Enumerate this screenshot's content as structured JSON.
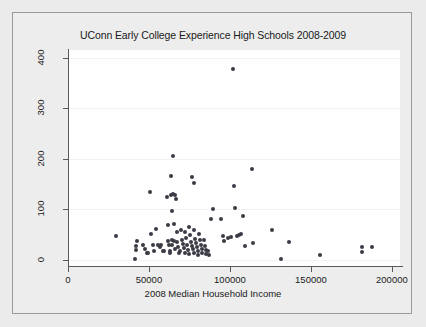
{
  "chart_data": {
    "type": "scatter",
    "title": "UConn Early College Experience High Schools 2008-2009",
    "xlabel": "2008 Median Household Income",
    "ylabel": "",
    "xlim": [
      0,
      205000
    ],
    "ylim": [
      -12,
      415
    ],
    "xticks": [
      0,
      50000,
      100000,
      150000,
      200000
    ],
    "xtick_labels": [
      "0",
      "50000",
      "100000",
      "150000",
      "200000"
    ],
    "yticks": [
      0,
      100,
      200,
      300,
      400
    ],
    "ytick_labels": [
      "0",
      "100",
      "200",
      "300",
      "400"
    ],
    "grid": "horizontal-faint",
    "legend": null,
    "marker_color": "#3b3b46",
    "panel_color": "#ffffff",
    "figure_color": "#ededed",
    "points": [
      [
        29800,
        48
      ],
      [
        41500,
        2
      ],
      [
        42000,
        20
      ],
      [
        42200,
        28
      ],
      [
        42400,
        38
      ],
      [
        46500,
        30
      ],
      [
        47500,
        22
      ],
      [
        48500,
        14
      ],
      [
        49500,
        14
      ],
      [
        50500,
        134
      ],
      [
        51500,
        52
      ],
      [
        52500,
        30
      ],
      [
        53000,
        18
      ],
      [
        54500,
        62
      ],
      [
        55500,
        30
      ],
      [
        56500,
        25
      ],
      [
        57500,
        30
      ],
      [
        58500,
        17
      ],
      [
        59500,
        17
      ],
      [
        61000,
        125
      ],
      [
        61500,
        70
      ],
      [
        62000,
        38
      ],
      [
        62500,
        30
      ],
      [
        62800,
        18
      ],
      [
        63000,
        14
      ],
      [
        63500,
        166
      ],
      [
        63800,
        128
      ],
      [
        64000,
        96
      ],
      [
        64200,
        40
      ],
      [
        64500,
        30
      ],
      [
        64800,
        205
      ],
      [
        65000,
        130
      ],
      [
        65200,
        72
      ],
      [
        65500,
        38
      ],
      [
        65800,
        22
      ],
      [
        66000,
        128
      ],
      [
        66500,
        120
      ],
      [
        67000,
        55
      ],
      [
        67500,
        36
      ],
      [
        68000,
        25
      ],
      [
        68500,
        14
      ],
      [
        69000,
        18
      ],
      [
        70000,
        60
      ],
      [
        70500,
        40
      ],
      [
        71000,
        32
      ],
      [
        71500,
        24
      ],
      [
        72000,
        14
      ],
      [
        72500,
        56
      ],
      [
        73000,
        44
      ],
      [
        73500,
        30
      ],
      [
        74000,
        20
      ],
      [
        74500,
        12
      ],
      [
        75000,
        66
      ],
      [
        75500,
        50
      ],
      [
        76000,
        36
      ],
      [
        76500,
        28
      ],
      [
        77000,
        22
      ],
      [
        77500,
        14
      ],
      [
        78000,
        60
      ],
      [
        78500,
        42
      ],
      [
        79000,
        34
      ],
      [
        79500,
        26
      ],
      [
        80000,
        18
      ],
      [
        80500,
        10
      ],
      [
        81000,
        52
      ],
      [
        81500,
        40
      ],
      [
        82000,
        30
      ],
      [
        82500,
        22
      ],
      [
        83000,
        14
      ],
      [
        76500,
        164
      ],
      [
        77500,
        152
      ],
      [
        84000,
        40
      ],
      [
        84500,
        28
      ],
      [
        85000,
        20
      ],
      [
        85500,
        12
      ],
      [
        86500,
        18
      ],
      [
        87000,
        10
      ],
      [
        88000,
        80
      ],
      [
        89500,
        100
      ],
      [
        94500,
        80
      ],
      [
        95500,
        48
      ],
      [
        96500,
        38
      ],
      [
        99000,
        44
      ],
      [
        100500,
        46
      ],
      [
        102000,
        378
      ],
      [
        102500,
        146
      ],
      [
        103000,
        102
      ],
      [
        104500,
        48
      ],
      [
        105500,
        50
      ],
      [
        107000,
        52
      ],
      [
        108000,
        86
      ],
      [
        109000,
        28
      ],
      [
        113500,
        180
      ],
      [
        114500,
        34
      ],
      [
        126000,
        60
      ],
      [
        131500,
        2
      ],
      [
        136500,
        35
      ],
      [
        155500,
        10
      ],
      [
        181500,
        16
      ],
      [
        181500,
        26
      ],
      [
        188000,
        26
      ]
    ]
  }
}
